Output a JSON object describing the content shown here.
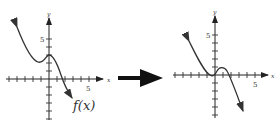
{
  "left_graph": {
    "function_label": "f(x)",
    "x_axis_label": "x",
    "y_axis_label": "y",
    "x_tick_label": "5",
    "y_tick_label": "5"
  },
  "transform_arrow": {
    "icon": "right-arrow-icon"
  },
  "right_graph": {
    "x_axis_label": "x",
    "y_axis_label": "y",
    "x_tick_label": "5",
    "y_tick_label": "5"
  },
  "colors": {
    "ink": "#333333",
    "arrow": "#111111",
    "background": "#ffffff"
  }
}
